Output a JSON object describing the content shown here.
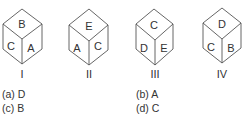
{
  "cubes": [
    {
      "label": "I",
      "top": "B",
      "left": "C",
      "right": "A"
    },
    {
      "label": "II",
      "top": "E",
      "left": "A",
      "right": "C"
    },
    {
      "label": "III",
      "top": "C",
      "left": "D",
      "right": "E"
    },
    {
      "label": "IV",
      "top": "D",
      "left": "C",
      "right": "B"
    }
  ],
  "options": [
    {
      "key": "(a)",
      "value": "D",
      "text": "(a) D"
    },
    {
      "key": "(b)",
      "value": "A",
      "text": "(b) A"
    },
    {
      "key": "(c)",
      "value": "B",
      "text": "(c) B"
    },
    {
      "key": "(d)",
      "value": "C",
      "text": "(d) C"
    }
  ],
  "colors": {
    "line": "#555555",
    "text": "#333333",
    "background": "#ffffff"
  }
}
